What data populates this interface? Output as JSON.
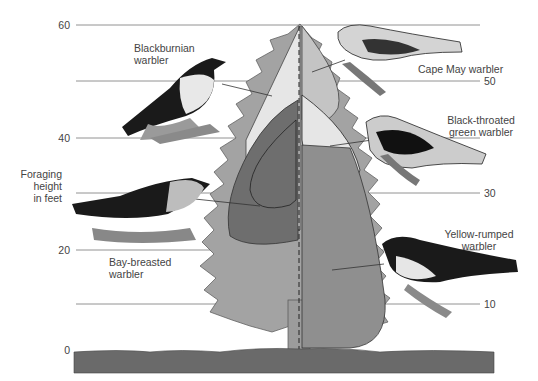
{
  "axis": {
    "title_line1": "Foraging",
    "title_line2": "height",
    "title_line3": "in feet",
    "ticks_left": [
      "60",
      "40",
      "20",
      "0"
    ],
    "ticks_right": [
      "50",
      "30",
      "10"
    ]
  },
  "species": [
    {
      "name_line1": "Blackburnian",
      "name_line2": "warbler",
      "zone": "upper outer canopy (left)"
    },
    {
      "name_line1": "Cape May warbler",
      "name_line2": "",
      "zone": "tree top (right)"
    },
    {
      "name_line1": "Black-throated",
      "name_line2": "green warbler",
      "zone": "upper inner canopy (right)"
    },
    {
      "name_line1": "Bay-breasted",
      "name_line2": "warbler",
      "zone": "middle inner canopy (left)"
    },
    {
      "name_line1": "Yellow-rumped",
      "name_line2": "warbler",
      "zone": "lower canopy (right)"
    }
  ],
  "colors": {
    "tree_outer": "#a3a3a3",
    "zone_light": "#e6e6e6",
    "zone_mid": "#c4c4c4",
    "zone_dark": "#6e6e6e",
    "zone_lower": "#8f8f8f",
    "ground": "#6a6a6a",
    "gridline": "#777777"
  }
}
